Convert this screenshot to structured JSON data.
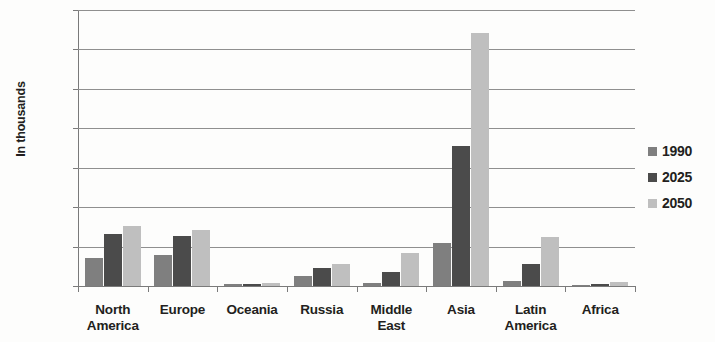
{
  "chart_data": {
    "type": "bar",
    "title": "",
    "xlabel": "",
    "ylabel": "In thousands",
    "ylim": [
      0,
      3500
    ],
    "ytick_step": 500,
    "yticks": [
      3500,
      3000,
      2500,
      2000,
      1500,
      1000,
      500,
      0
    ],
    "grid": true,
    "legend_position": "right",
    "categories": [
      "North America",
      "Europe",
      "Oceania",
      "Russia",
      "Middle East",
      "Asia",
      "Latin America",
      "Africa"
    ],
    "category_lines": [
      [
        "North",
        "America"
      ],
      [
        "Europe",
        ""
      ],
      [
        "Oceania",
        ""
      ],
      [
        "Russia",
        ""
      ],
      [
        "Middle",
        "East"
      ],
      [
        "Asia",
        ""
      ],
      [
        "Latin",
        "America"
      ],
      [
        "Africa",
        ""
      ]
    ],
    "series": [
      {
        "name": "1990",
        "color": "#7f7f7f",
        "values": [
          355,
          395,
          20,
          130,
          40,
          550,
          65,
          10
        ]
      },
      {
        "name": "2025",
        "color": "#4b4b4b",
        "values": [
          665,
          640,
          30,
          230,
          175,
          1770,
          285,
          25
        ]
      },
      {
        "name": "2050",
        "color": "#bfbfbf",
        "values": [
          760,
          715,
          40,
          280,
          415,
          3210,
          625,
          45
        ]
      }
    ]
  },
  "legend": {
    "items": [
      {
        "label": "1990",
        "color": "#7f7f7f"
      },
      {
        "label": "2025",
        "color": "#4b4b4b"
      },
      {
        "label": "2050",
        "color": "#bfbfbf"
      }
    ]
  },
  "axis": {
    "y_title": "In thousands"
  },
  "colors": {
    "series_1990": "#7f7f7f",
    "series_2025": "#4b4b4b",
    "series_2050": "#bfbfbf",
    "gridline": "#8f8f8f",
    "text": "#231f20",
    "background": "#fdfdfc"
  }
}
